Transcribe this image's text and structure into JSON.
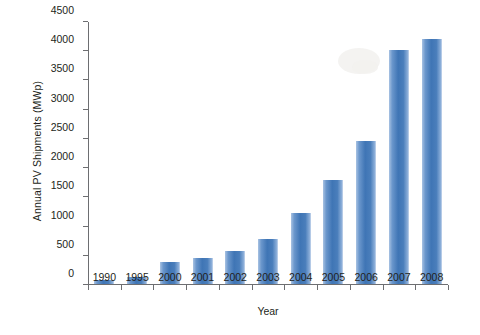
{
  "chart_data": {
    "type": "bar",
    "title": "",
    "xlabel": "Year",
    "ylabel": "Annual PV Shipments (MWp)",
    "categories": [
      "1990",
      "1995",
      "2000",
      "2001",
      "2002",
      "2003",
      "2004",
      "2005",
      "2006",
      "2007",
      "2008"
    ],
    "values": [
      75,
      120,
      375,
      440,
      560,
      770,
      1220,
      1780,
      2450,
      4000,
      4200
    ],
    "ylim": [
      0,
      4500
    ],
    "yticks": [
      0,
      500,
      1000,
      1500,
      2000,
      2500,
      3000,
      3500,
      4000,
      4500
    ],
    "ytick_labels": [
      "0",
      "500",
      "1000",
      "1500",
      "2000",
      "2500",
      "3000",
      "3500",
      "4000",
      "4500"
    ],
    "grid": false,
    "legend": null,
    "bar_color": "#4a7ebb",
    "axis_color": "#6d6e71",
    "text_color": "#231f20",
    "background": "#ffffff"
  }
}
